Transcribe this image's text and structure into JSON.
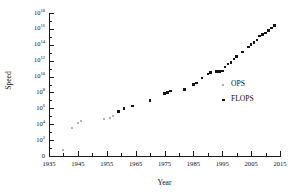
{
  "chart_data": {
    "type": "scatter",
    "title": "",
    "xlabel": "Year",
    "ylabel": "Speed",
    "xlim": [
      1935,
      2015
    ],
    "ylim_exponent": [
      0,
      18
    ],
    "yscale": "log",
    "grid": false,
    "legend_position": "right",
    "x_ticks": [
      "1935",
      "1945",
      "1955",
      "1965",
      "1975",
      "1985",
      "1995",
      "2005",
      "2015"
    ],
    "x_tick_values": [
      1935,
      1945,
      1955,
      1965,
      1975,
      1985,
      1995,
      2005,
      2015
    ],
    "x_minor_tick_values": [
      1940,
      1950,
      1960,
      1970,
      1980,
      1990,
      2000,
      2010
    ],
    "y_ticks": [
      {
        "label": "0",
        "base": "0",
        "exp": "",
        "value_exp": 0
      },
      {
        "label": "10^2",
        "base": "10",
        "exp": "2",
        "value_exp": 2
      },
      {
        "label": "10^4",
        "base": "10",
        "exp": "4",
        "value_exp": 4
      },
      {
        "label": "10^6",
        "base": "10",
        "exp": "6",
        "value_exp": 6
      },
      {
        "label": "10^8",
        "base": "10",
        "exp": "8",
        "value_exp": 8
      },
      {
        "label": "10^10",
        "base": "10",
        "exp": "10",
        "value_exp": 10
      },
      {
        "label": "10^12",
        "base": "10",
        "exp": "12",
        "value_exp": 12
      },
      {
        "label": "10^14",
        "base": "10",
        "exp": "14",
        "value_exp": 14
      },
      {
        "label": "10^16",
        "base": "10",
        "exp": "16",
        "value_exp": 16
      },
      {
        "label": "10^18",
        "base": "10",
        "exp": "18",
        "value_exp": 18
      }
    ],
    "y_minor_tick_exponents": [
      1,
      3,
      5,
      7,
      9,
      11,
      13,
      15,
      17
    ],
    "series": [
      {
        "name": "OPS",
        "marker": "small-light-square",
        "color": "#b2b2b2",
        "points": [
          {
            "x": 1940,
            "y_exp": 0.8
          },
          {
            "x": 1943,
            "y_exp": 3.5
          },
          {
            "x": 1945,
            "y_exp": 4.2
          },
          {
            "x": 1946,
            "y_exp": 4.4
          },
          {
            "x": 1954,
            "y_exp": 4.7
          },
          {
            "x": 1956,
            "y_exp": 4.8
          },
          {
            "x": 1957,
            "y_exp": 5.0
          }
        ]
      },
      {
        "name": "FLOPS",
        "marker": "small-dark-square",
        "color": "#141414",
        "points": [
          {
            "x": 1959,
            "y_exp": 5.6
          },
          {
            "x": 1961,
            "y_exp": 6.0
          },
          {
            "x": 1964,
            "y_exp": 6.3
          },
          {
            "x": 1970,
            "y_exp": 7.0
          },
          {
            "x": 1975,
            "y_exp": 7.9
          },
          {
            "x": 1976,
            "y_exp": 8.0
          },
          {
            "x": 1977,
            "y_exp": 8.2
          },
          {
            "x": 1982,
            "y_exp": 8.4
          },
          {
            "x": 1985,
            "y_exp": 9.0
          },
          {
            "x": 1986,
            "y_exp": 9.2
          },
          {
            "x": 1988,
            "y_exp": 9.8
          },
          {
            "x": 1990,
            "y_exp": 10.3
          },
          {
            "x": 1991,
            "y_exp": 10.5
          },
          {
            "x": 1993,
            "y_exp": 10.6
          },
          {
            "x": 1994,
            "y_exp": 10.6
          },
          {
            "x": 1995,
            "y_exp": 10.7
          },
          {
            "x": 1996,
            "y_exp": 11.2
          },
          {
            "x": 1997,
            "y_exp": 11.6
          },
          {
            "x": 1998,
            "y_exp": 11.8
          },
          {
            "x": 1999,
            "y_exp": 12.2
          },
          {
            "x": 2000,
            "y_exp": 12.5
          },
          {
            "x": 2002,
            "y_exp": 13.1
          },
          {
            "x": 2004,
            "y_exp": 13.7
          },
          {
            "x": 2005,
            "y_exp": 14.0
          },
          {
            "x": 2006,
            "y_exp": 14.3
          },
          {
            "x": 2007,
            "y_exp": 14.6
          },
          {
            "x": 2008,
            "y_exp": 15.1
          },
          {
            "x": 2009,
            "y_exp": 15.3
          },
          {
            "x": 2010,
            "y_exp": 15.5
          },
          {
            "x": 2011,
            "y_exp": 15.8
          },
          {
            "x": 2012,
            "y_exp": 16.1
          },
          {
            "x": 2013,
            "y_exp": 16.4
          }
        ]
      }
    ],
    "legend": [
      {
        "name": "OPS",
        "marker": "small-light-square",
        "color": "#b2b2b2"
      },
      {
        "name": "FLOPS",
        "marker": "small-dark-square",
        "color": "#141414"
      }
    ]
  }
}
